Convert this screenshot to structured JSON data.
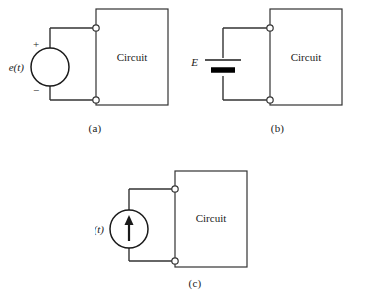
{
  "figure": {
    "background_color": "#ffffff",
    "line_color": "#333333",
    "text_color": "#1a1a1a"
  },
  "panels": [
    {
      "id": "a",
      "caption": "(a)",
      "source_type": "ac-voltage-source",
      "source_label": "e(t)",
      "polarity_plus": "+",
      "polarity_minus": "−",
      "block_label": "Circuit",
      "terminal_count": 2
    },
    {
      "id": "b",
      "caption": "(b)",
      "source_type": "dc-battery",
      "source_label": "E",
      "block_label": "Circuit",
      "terminal_count": 2
    },
    {
      "id": "c",
      "caption": "(c)",
      "source_type": "current-source",
      "source_label": "i(t)",
      "block_label": "Circuit",
      "terminal_count": 2
    }
  ]
}
